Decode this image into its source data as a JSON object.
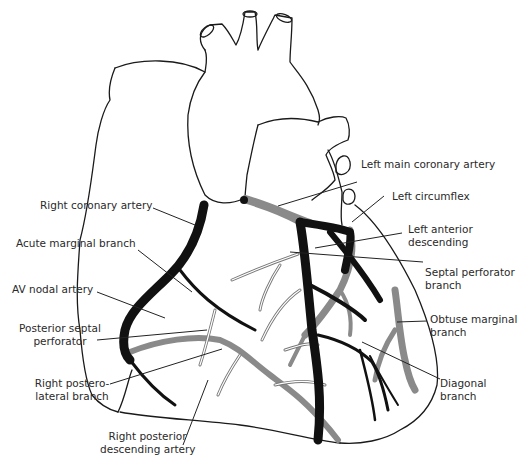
{
  "figure": {
    "type": "anatomical-diagram",
    "colors": {
      "outline": "#1a1a1a",
      "anterior_vessels": "#111111",
      "posterior_vessels": "#8a8a8a",
      "background": "#ffffff"
    }
  },
  "labels": {
    "left_main": "Left main coronary artery",
    "left_circumflex": "Left circumflex",
    "lad_line1": "Left anterior",
    "lad_line2": "descending",
    "septal_line1": "Septal perforator",
    "septal_line2": "branch",
    "obtuse_line1": "Obtuse marginal",
    "obtuse_line2": "branch",
    "diagonal_line1": "Diagonal",
    "diagonal_line2": "branch",
    "rca": "Right coronary artery",
    "acute_marginal": "Acute marginal branch",
    "av_nodal": "AV nodal artery",
    "post_septal_line1": "Posterior septal",
    "post_septal_line2": "perforator",
    "rpl_line1": "Right postero-",
    "rpl_line2": "lateral branch",
    "rpda_line1": "Right posterior",
    "rpda_line2": "descending artery"
  }
}
